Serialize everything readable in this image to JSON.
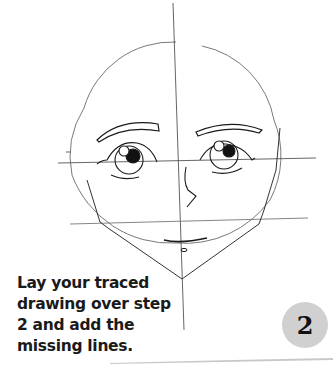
{
  "tutorial": {
    "instruction_lines": [
      "Lay your traced",
      "drawing over step",
      "2 and add the",
      "missing lines."
    ],
    "step_number": "2"
  },
  "drawing": {
    "subject": "face-sketch",
    "stroke_color": "#1a1a1a",
    "guide_color": "#555555",
    "elements": [
      "head-circle",
      "vertical-guide",
      "eye-line-guide",
      "nose-line-guide",
      "jaw-outline",
      "left-eyebrow",
      "right-eyebrow",
      "left-eye",
      "right-eye",
      "nose",
      "mouth",
      "chin-mark"
    ]
  },
  "colors": {
    "badge_bg": "#d0d0d0",
    "text": "#1a1a1a",
    "page_shadow": "#c8c8c8"
  }
}
